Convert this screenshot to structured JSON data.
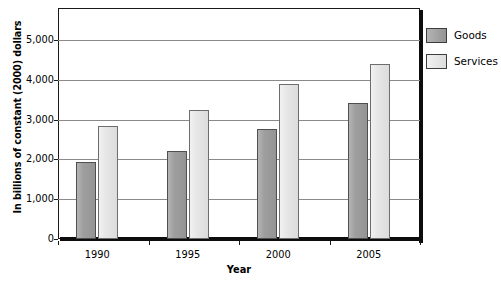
{
  "chart_data": {
    "type": "bar",
    "title": "",
    "xlabel": "Year",
    "ylabel": "In billions of constant (2000) dollars",
    "categories": [
      "1990",
      "1995",
      "2000",
      "2005"
    ],
    "series": [
      {
        "name": "Goods",
        "values": [
          1930,
          2220,
          2750,
          3420
        ],
        "color": "#9a9a9a"
      },
      {
        "name": "Services",
        "values": [
          2840,
          3230,
          3880,
          4400
        ],
        "color": "#e6e6e6"
      }
    ],
    "ylim": [
      0,
      5800
    ],
    "yticks": [
      0,
      1000,
      2000,
      3000,
      4000,
      5000
    ],
    "ytick_labels": [
      "0",
      "1,000",
      "2,000",
      "3,000",
      "4,000",
      "5,000"
    ],
    "grid": true,
    "legend_position": "right"
  },
  "legend": {
    "items": [
      {
        "label": "Goods"
      },
      {
        "label": "Services"
      }
    ]
  }
}
